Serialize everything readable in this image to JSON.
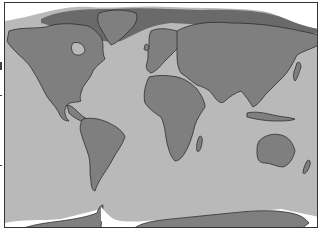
{
  "map": {
    "type": "world-map",
    "projection": "equirectangular",
    "style": "grayscale",
    "colors": {
      "ocean": "#b9b9b9",
      "land": "#7f7f7f",
      "coast": "#2e2e2e",
      "sea_ice": "#6a6a6a",
      "polar_white": "#ffffff",
      "frame": "#333333"
    },
    "regions": [
      {
        "name": "North America",
        "kind": "land"
      },
      {
        "name": "Greenland",
        "kind": "land"
      },
      {
        "name": "South America",
        "kind": "land"
      },
      {
        "name": "Europe",
        "kind": "land"
      },
      {
        "name": "Africa",
        "kind": "land"
      },
      {
        "name": "Asia",
        "kind": "land"
      },
      {
        "name": "Australia",
        "kind": "land"
      },
      {
        "name": "Antarctica",
        "kind": "land"
      },
      {
        "name": "Arctic sea ice",
        "kind": "overlay"
      }
    ]
  }
}
